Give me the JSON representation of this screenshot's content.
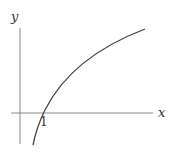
{
  "diagram": {
    "type": "function-graph",
    "function": "y = log(x)",
    "axes": {
      "x_label": "x",
      "y_label": "y"
    },
    "ticks": {
      "x_intercept_label": "1"
    },
    "colors": {
      "axis": "#7a7a7a",
      "curve": "#444444",
      "text": "#333333"
    }
  }
}
